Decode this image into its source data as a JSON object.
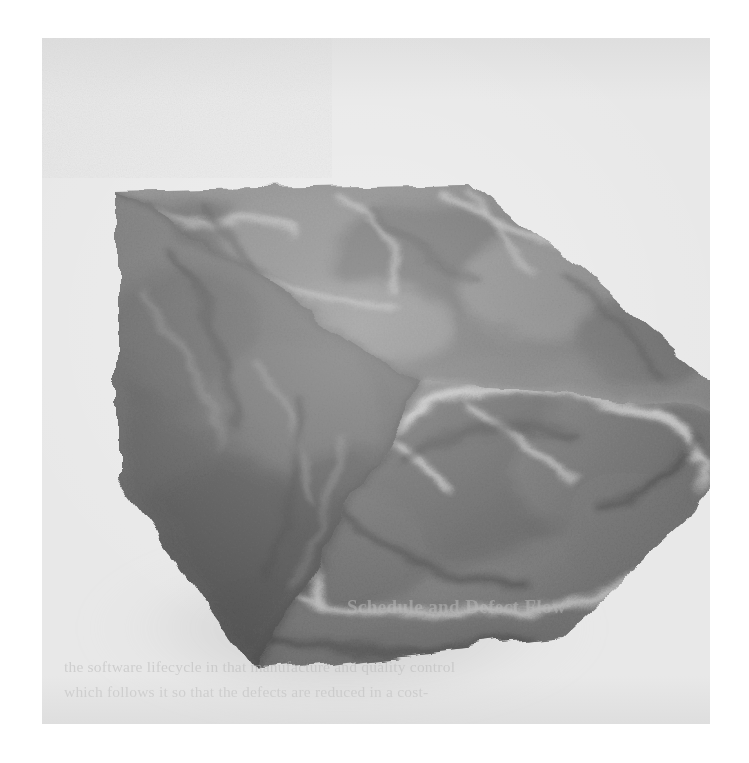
{
  "document": {
    "kind": "scanned-page",
    "background_color": "#ffffff"
  },
  "scan_panel": {
    "name": "scanned-image-panel",
    "background_color": "#e8e8e8",
    "left": 42,
    "top": 38,
    "width": 668,
    "height": 686
  },
  "figure": {
    "caption_visible": false,
    "render_type": "volume-rendering",
    "colors": {
      "top_face": "#787878",
      "left_face": "#6b6b6b",
      "right_face": "#8a8a8a",
      "highlight": "#c9c9c9",
      "shadow": "#4a4a4a",
      "outline": "#5c5c5c"
    },
    "geometry": {
      "top_vertex": [
        430,
        143
      ],
      "left_vertex": [
        75,
        150
      ],
      "right_vertex": [
        700,
        370
      ],
      "bottom_vertex": [
        215,
        632
      ],
      "front_vertex": [
        378,
        345
      ],
      "note": "isometric-like cube, viewed from above-left"
    }
  },
  "bleed_through_text": {
    "note": "faint show-through text from the reverse side of the page; nearly illegible",
    "heading": "Schedule and Defect Flow",
    "line_1": "the software lifecycle in that manufacture and quality control",
    "line_2": "which follows it so that the defects are reduced in a cost-",
    "line_3": ""
  },
  "page_footer": {
    "text": ""
  }
}
